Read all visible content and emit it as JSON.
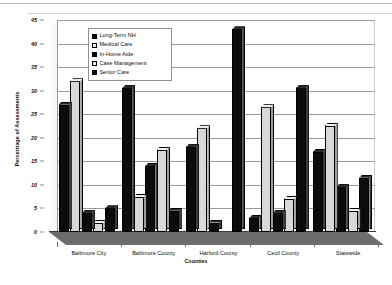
{
  "chart_data": {
    "type": "bar",
    "title": "",
    "xlabel": "Counties",
    "ylabel": "Percentage of Assessments",
    "ylim": [
      0,
      45
    ],
    "ytick_step": 5,
    "yticks": [
      0,
      5,
      10,
      15,
      20,
      25,
      30,
      35,
      40,
      45
    ],
    "grid": true,
    "legend_position": "top-left-inside",
    "categories": [
      "Baltimore City",
      "Baltimore County",
      "Harford County",
      "Cecil County",
      "Statewide"
    ],
    "series": [
      {
        "name": "Long-Term NH",
        "color": "#0c0c0c",
        "fill": "dark",
        "values": [
          27.0,
          30.5,
          18.0,
          3.0,
          17.0
        ]
      },
      {
        "name": "Medical Care",
        "color": "#d8d8d8",
        "fill": "light",
        "values": [
          32.0,
          7.5,
          22.0,
          26.5,
          22.5
        ]
      },
      {
        "name": "In-Home Aide",
        "color": "#0c0c0c",
        "fill": "dark",
        "values": [
          4.0,
          14.0,
          2.0,
          4.0,
          9.5
        ]
      },
      {
        "name": "Case Management",
        "color": "#d8d8d8",
        "fill": "light",
        "values": [
          2.0,
          17.5,
          0.0,
          7.0,
          4.5
        ]
      },
      {
        "name": "Senior Care",
        "color": "#0c0c0c",
        "fill": "dark",
        "values": [
          5.0,
          4.5,
          43.0,
          30.5,
          11.5
        ]
      }
    ]
  },
  "axis": {
    "y_title": "Percentage of Assessments",
    "x_title": "Counties"
  }
}
